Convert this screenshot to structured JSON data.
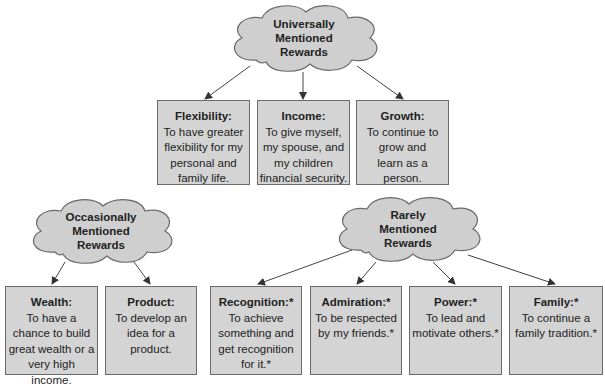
{
  "categories": {
    "universal": {
      "line1": "Universally",
      "line2": "Mentioned",
      "line3": "Rewards"
    },
    "occasional": {
      "line1": "Occasionally",
      "line2": "Mentioned",
      "line3": "Rewards"
    },
    "rare": {
      "line1": "Rarely",
      "line2": "Mentioned",
      "line3": "Rewards"
    }
  },
  "rewards": {
    "flexibility": {
      "title": "Flexibility:",
      "desc": "To have greater flexibility for my personal and family life."
    },
    "income": {
      "title": "Income:",
      "desc": "To give myself, my spouse, and my children financial security."
    },
    "growth": {
      "title": "Growth:",
      "desc": "To continue to grow and learn as a person."
    },
    "wealth": {
      "title": "Wealth:",
      "desc": "To have a chance to build great wealth or a very high income."
    },
    "product": {
      "title": "Product:",
      "desc": "To develop an idea for a product."
    },
    "recognition": {
      "title": "Recognition:*",
      "desc": "To achieve something and get recognition for it.*"
    },
    "admiration": {
      "title": "Admiration:*",
      "desc": "To be respected by my friends.*"
    },
    "power": {
      "title": "Power:*",
      "desc": "To lead and motivate others.*"
    },
    "family": {
      "title": "Family:*",
      "desc": "To continue a family tradition.*"
    }
  },
  "colors": {
    "box_fill": "#d4d4d4",
    "cloud_fill": "#cfcfcf",
    "outline": "#6a6a6a"
  }
}
